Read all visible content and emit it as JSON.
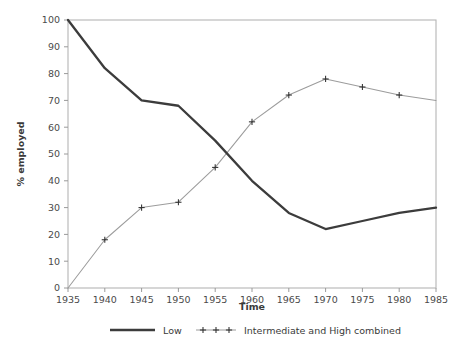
{
  "chart_data": {
    "type": "line",
    "title": "",
    "xlabel": "Time",
    "ylabel": "% employed",
    "x": [
      1935,
      1940,
      1945,
      1950,
      1955,
      1960,
      1965,
      1970,
      1975,
      1980,
      1985
    ],
    "xlim": [
      1935,
      1985
    ],
    "ylim": [
      0,
      100
    ],
    "xticks": [
      "1935",
      "1940",
      "1945",
      "1950",
      "1955",
      "1960",
      "1965",
      "1970",
      "1975",
      "1980",
      "1985"
    ],
    "yticks": [
      "0",
      "10",
      "20",
      "30",
      "40",
      "50",
      "60",
      "70",
      "80",
      "90",
      "100"
    ],
    "grid": false,
    "legend_position": "bottom",
    "series": [
      {
        "name": "Low",
        "color": "#3c3c3c",
        "marker": "none",
        "values": [
          100,
          82,
          70,
          68,
          55,
          40,
          28,
          22,
          25,
          28,
          30
        ]
      },
      {
        "name": "Intermediate and High combined",
        "color": "#9c9c9c",
        "marker": "plus",
        "values": [
          0,
          18,
          30,
          32,
          45,
          62,
          72,
          78,
          75,
          72,
          70
        ]
      }
    ]
  },
  "axes": {
    "x_title": "Time",
    "y_title": "% employed"
  },
  "legend": {
    "entries": [
      {
        "label": "Low"
      },
      {
        "label": "Intermediate and High combined"
      }
    ]
  }
}
